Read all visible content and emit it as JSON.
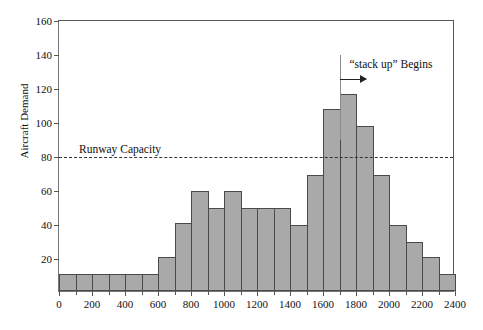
{
  "chart_data": {
    "type": "bar",
    "title": "",
    "xlabel": "",
    "ylabel": "Aircraft Demand",
    "xlim": [
      0,
      2400
    ],
    "ylim": [
      0,
      160
    ],
    "grid": false,
    "legend": null,
    "bin_width": 100,
    "x_ticks": [
      0,
      200,
      400,
      600,
      800,
      1000,
      1200,
      1400,
      1600,
      1800,
      2000,
      2200,
      2400
    ],
    "x_tick_labels": [
      "0",
      "200",
      "400",
      "600",
      "800",
      "1000",
      "1200",
      "1400",
      "1600",
      "1800",
      "2000",
      "2200",
      "2400"
    ],
    "x_minor_ticks": [
      100,
      300,
      500,
      700,
      900,
      1100,
      1300,
      1500,
      1700,
      1900,
      2100,
      2300
    ],
    "y_ticks": [
      20,
      40,
      60,
      80,
      100,
      120,
      140,
      160
    ],
    "y_tick_labels": [
      "20",
      "40",
      "60",
      "80",
      "100",
      "120",
      "140",
      "160"
    ],
    "categories": [
      "0-100",
      "100-200",
      "200-300",
      "300-400",
      "400-500",
      "500-600",
      "600-700",
      "700-800",
      "800-900",
      "900-1000",
      "1000-1100",
      "1100-1200",
      "1200-1300",
      "1300-1400",
      "1400-1500",
      "1500-1600",
      "1600-1700",
      "1700-1800",
      "1800-1900",
      "1900-2000",
      "2000-2100",
      "2100-2200",
      "2200-2300",
      "2300-2400"
    ],
    "bin_starts": [
      0,
      100,
      200,
      300,
      400,
      500,
      600,
      700,
      800,
      900,
      1000,
      1100,
      1200,
      1300,
      1400,
      1500,
      1600,
      1700,
      1800,
      1900,
      2000,
      2100,
      2200,
      2300
    ],
    "values": [
      10,
      10,
      10,
      10,
      10,
      10,
      20,
      40,
      59,
      49,
      59,
      49,
      49,
      49,
      39,
      68,
      107,
      116,
      97,
      68,
      39,
      29,
      20,
      10
    ],
    "annotations": [
      {
        "name": "runway-capacity",
        "label": "Runway Capacity",
        "value": 80,
        "style": "dashed-horizontal-line",
        "label_x": 370
      },
      {
        "name": "stack-up-begins",
        "label": "“stack up” Begins",
        "x": 1700,
        "arrow_from": 1700,
        "arrow_to": 1860,
        "arrow_y": 126,
        "vline_top": 140,
        "vline_bottom": 90,
        "label_x": 1760,
        "label_y": 138
      }
    ],
    "colors": {
      "bar_fill": "#a9a9a9",
      "bar_edge": "#4a4a4a",
      "axis": "#555555",
      "capacity_line": "#333333",
      "annotation_line": "#8a8a8a",
      "text": "#111111",
      "background": "#ffffff"
    }
  }
}
